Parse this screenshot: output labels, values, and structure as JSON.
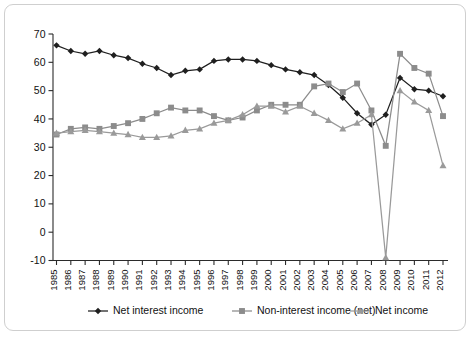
{
  "chart_data": {
    "type": "line",
    "title": "",
    "subtitle": "",
    "xlabel": "",
    "ylabel": "",
    "xlim": [
      1985,
      2012
    ],
    "ylim": [
      -10,
      70
    ],
    "ytick_step": 10,
    "grid": false,
    "legend_position": "bottom",
    "categories": [
      "1985",
      "1986",
      "1987",
      "1988",
      "1989",
      "1990",
      "1991",
      "1992",
      "1993",
      "1994",
      "1995",
      "1996",
      "1997",
      "1998",
      "1999",
      "2000",
      "2001",
      "2002",
      "2003",
      "2004",
      "2005",
      "2006",
      "2007",
      "2008",
      "2009",
      "2010",
      "2011",
      "2012"
    ],
    "yticks": [
      -10,
      0,
      10,
      20,
      30,
      40,
      50,
      60,
      70
    ],
    "series": [
      {
        "name": "Net interest income",
        "color": "#1f1f1f",
        "marker": "diamond",
        "values": [
          66,
          64,
          63,
          64,
          62.5,
          61.5,
          59.5,
          58,
          55.5,
          57,
          57.5,
          60.5,
          61,
          61,
          60.5,
          59,
          57.5,
          56.5,
          55.5,
          52,
          47.5,
          42,
          38,
          41.5,
          54.5,
          50.5,
          50,
          48
        ]
      },
      {
        "name": "Non-interest income (net)",
        "color": "#8c8c8c",
        "marker": "square",
        "values": [
          34.5,
          36.5,
          37,
          36.5,
          37.5,
          38.5,
          40,
          42,
          44,
          43,
          43,
          41,
          39.5,
          40.5,
          43,
          45,
          45,
          45,
          51.5,
          52.5,
          49.5,
          52.5,
          43,
          30.5,
          63,
          58,
          56,
          41
        ]
      },
      {
        "name": "Net income",
        "color": "#9a9a9a",
        "marker": "triangle",
        "values": [
          35,
          35.5,
          36,
          35.5,
          35,
          34.5,
          33.5,
          33.5,
          34,
          36,
          36.5,
          38.5,
          39.5,
          41.5,
          44.5,
          44.5,
          42.5,
          44.5,
          42,
          39.5,
          36.5,
          38.5,
          41.5,
          -9,
          50,
          46,
          43,
          23.5
        ]
      }
    ]
  },
  "legend": {
    "items": [
      {
        "label": "Net interest income",
        "marker": "diamond",
        "color": "#1f1f1f"
      },
      {
        "label": "Non-interest income (net)",
        "marker": "square",
        "color": "#8c8c8c"
      },
      {
        "label": "Net income",
        "marker": "triangle",
        "color": "#9a9a9a"
      }
    ]
  }
}
